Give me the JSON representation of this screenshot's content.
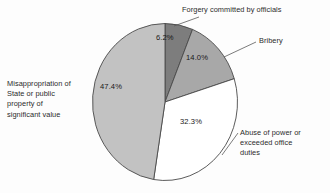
{
  "chart_data": {
    "type": "pie",
    "title": "",
    "subtitle": "",
    "xlabel": "",
    "ylabel": "",
    "legend_position": "callout-labels",
    "grid": false,
    "start_angle_deg": 0,
    "direction": "clockwise",
    "categories": [
      "Forgery committed by officials",
      "Bribery",
      "Abuse of power or exceeded office duties",
      "Misappropriation of State or public property of significant value"
    ],
    "values": [
      6.2,
      14.0,
      32.3,
      47.4
    ],
    "value_labels": [
      "6.2%",
      "14.0%",
      "32.3%",
      "47.4%"
    ],
    "colors": [
      "#7d7d7d",
      "#a8a8a8",
      "#ffffff",
      "#c2c2c2"
    ],
    "slices": [
      {
        "name": "Forgery committed by officials",
        "value": 6.2,
        "label": "6.2%",
        "color": "#7d7d7d",
        "start_deg": 0.0,
        "end_deg": 22.32
      },
      {
        "name": "Bribery",
        "value": 14.0,
        "label": "14.0%",
        "color": "#a8a8a8",
        "start_deg": 22.32,
        "end_deg": 72.72
      },
      {
        "name": "Abuse of power or exceeded office duties",
        "value": 32.3,
        "label": "32.3%",
        "color": "#ffffff",
        "start_deg": 72.72,
        "end_deg": 189.0
      },
      {
        "name": "Misappropriation of State or public property of significant value",
        "value": 47.4,
        "label": "47.4%",
        "color": "#c2c2c2",
        "start_deg": 189.0,
        "end_deg": 360.0
      }
    ]
  },
  "labels": {
    "forgery": "Forgery committed by officials",
    "bribery": "Bribery",
    "abuse": "Abuse of power or\nexceeded office\nduties",
    "misappropriation": "Misappropriation of\nState or public\nproperty of\nsignificant value"
  },
  "percents": {
    "forgery": "6.2%",
    "bribery": "14.0%",
    "abuse": "32.3%",
    "misappropriation": "47.4%"
  },
  "style": {
    "outline_color": "#4a4a4a",
    "leader_color": "#5a5a5a",
    "background": "#fdfdfd"
  }
}
